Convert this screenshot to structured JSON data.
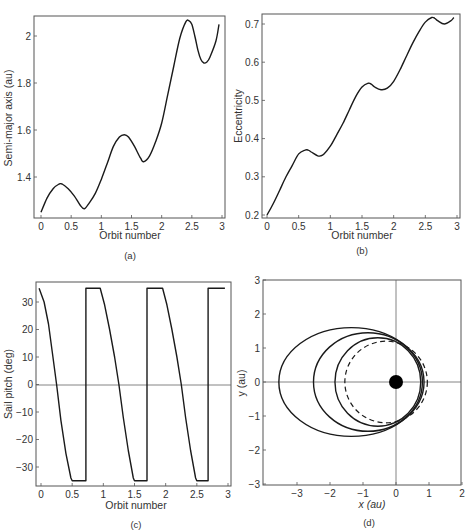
{
  "chart_data": [
    {
      "panel": "a",
      "type": "line",
      "caption": "(a)",
      "xlabel": "Orbit number",
      "ylabel": "Semi-major axis (au)",
      "xlim": [
        0,
        3
      ],
      "ylim": [
        1.22,
        2.08
      ],
      "xticks": [
        "0",
        "0.5",
        "1",
        "1.5",
        "2",
        "2.5",
        "3"
      ],
      "yticks": [
        "1.4",
        "1.6",
        "1.8",
        "2"
      ],
      "x": [
        0,
        0.1,
        0.2,
        0.3,
        0.35,
        0.45,
        0.55,
        0.65,
        0.72,
        0.8,
        0.9,
        1.0,
        1.1,
        1.2,
        1.3,
        1.38,
        1.45,
        1.55,
        1.65,
        1.7,
        1.8,
        1.9,
        2.0,
        2.1,
        2.2,
        2.3,
        2.4,
        2.45,
        2.5,
        2.55,
        2.6,
        2.65,
        2.7,
        2.75,
        2.8,
        2.9,
        2.95
      ],
      "y": [
        1.25,
        1.31,
        1.35,
        1.37,
        1.37,
        1.35,
        1.32,
        1.28,
        1.265,
        1.29,
        1.33,
        1.39,
        1.46,
        1.53,
        1.57,
        1.58,
        1.57,
        1.53,
        1.48,
        1.465,
        1.49,
        1.55,
        1.63,
        1.75,
        1.87,
        1.99,
        2.06,
        2.065,
        2.05,
        2.0,
        1.94,
        1.9,
        1.885,
        1.89,
        1.91,
        1.98,
        2.05
      ]
    },
    {
      "panel": "b",
      "type": "line",
      "caption": "(b)",
      "xlabel": "Orbit number",
      "ylabel": "Eccentricity",
      "xlim": [
        0,
        3
      ],
      "ylim": [
        0.19,
        0.73
      ],
      "xticks": [
        "0",
        "0.5",
        "1",
        "1.5",
        "2",
        "2.5",
        "3"
      ],
      "yticks": [
        "0.2",
        "0.3",
        "0.4",
        "0.5",
        "0.6",
        "0.7"
      ],
      "x": [
        0,
        0.1,
        0.2,
        0.3,
        0.4,
        0.5,
        0.6,
        0.65,
        0.7,
        0.8,
        0.85,
        0.9,
        1.0,
        1.1,
        1.2,
        1.3,
        1.4,
        1.5,
        1.6,
        1.65,
        1.7,
        1.8,
        1.9,
        2.0,
        2.1,
        2.2,
        2.3,
        2.4,
        2.5,
        2.6,
        2.65,
        2.7,
        2.8,
        2.9,
        2.95
      ],
      "y": [
        0.2,
        0.23,
        0.265,
        0.3,
        0.33,
        0.36,
        0.37,
        0.37,
        0.365,
        0.355,
        0.355,
        0.36,
        0.38,
        0.41,
        0.44,
        0.475,
        0.51,
        0.535,
        0.545,
        0.542,
        0.535,
        0.528,
        0.532,
        0.55,
        0.58,
        0.615,
        0.65,
        0.68,
        0.705,
        0.717,
        0.715,
        0.708,
        0.7,
        0.708,
        0.717
      ]
    },
    {
      "panel": "c",
      "type": "line",
      "caption": "(c)",
      "xlabel": "Orbit number",
      "ylabel": "Sail pitch (deg)",
      "xlim": [
        0,
        3
      ],
      "ylim": [
        -37,
        37
      ],
      "xticks": [
        "0",
        "0.5",
        "1",
        "1.5",
        "2",
        "2.5",
        "3"
      ],
      "yticks": [
        "-30",
        "-20",
        "-10",
        "0",
        "10",
        "20",
        "30"
      ],
      "x": [
        -0.03,
        0.05,
        0.12,
        0.18,
        0.25,
        0.32,
        0.4,
        0.48,
        0.5,
        0.72,
        0.72,
        0.95,
        1.02,
        1.1,
        1.18,
        1.25,
        1.32,
        1.4,
        1.48,
        1.5,
        1.7,
        1.7,
        1.95,
        2.02,
        2.1,
        2.18,
        2.25,
        2.32,
        2.4,
        2.48,
        2.5,
        2.68,
        2.68,
        2.95
      ],
      "y": [
        35,
        30,
        22,
        12,
        0,
        -13,
        -25,
        -34,
        -35,
        -35,
        35,
        35,
        29,
        20,
        10,
        0,
        -12,
        -24,
        -34,
        -35,
        -35,
        35,
        35,
        29,
        20,
        10,
        0,
        -12,
        -24,
        -34,
        -35,
        -35,
        35,
        35
      ]
    },
    {
      "panel": "d",
      "type": "line",
      "caption": "(d)",
      "xlabel": "x (au)",
      "ylabel": "y (au)",
      "xlim": [
        -4,
        2
      ],
      "ylim": [
        -3,
        3
      ],
      "xticks": [
        "-3",
        "-2",
        "-1",
        "0",
        "1",
        "2"
      ],
      "yticks": [
        "-3",
        "-2",
        "-1",
        "0",
        "1",
        "2",
        "3"
      ],
      "sun": {
        "x": 0,
        "y": 0
      },
      "series": [
        {
          "name": "initial orbit (dashed)",
          "style": "dashed",
          "center_x": -0.3,
          "rx": 1.25,
          "ry": 1.2
        },
        {
          "name": "orbit 1",
          "style": "solid",
          "center_x": -0.55,
          "rx": 1.3,
          "ry": 1.3
        },
        {
          "name": "orbit 2",
          "style": "solid",
          "center_x": -0.85,
          "rx": 1.65,
          "ry": 1.45
        },
        {
          "name": "orbit 3",
          "style": "solid",
          "center_x": -1.35,
          "rx": 2.2,
          "ry": 1.6
        }
      ]
    }
  ]
}
